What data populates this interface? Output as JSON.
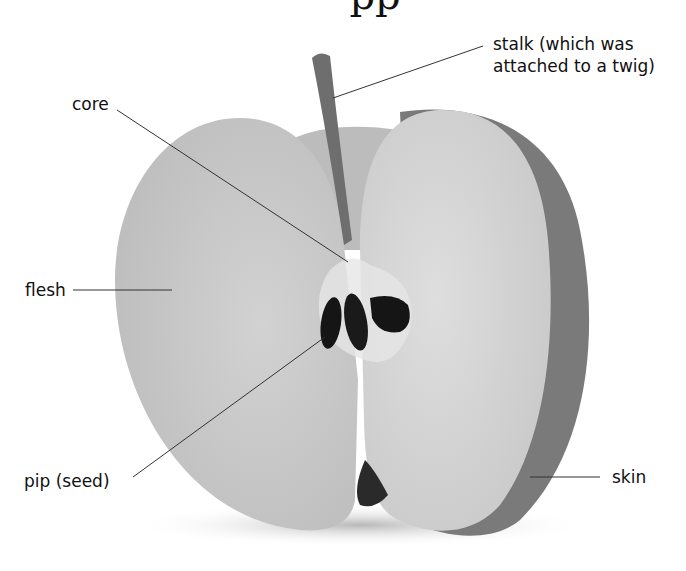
{
  "diagram": {
    "title_fragment": "pp",
    "labels": {
      "stalk": "stalk (which was",
      "stalk_line2": "attached to a twig)",
      "core": "core",
      "flesh": "flesh",
      "pip": "pip (seed)",
      "skin": "skin"
    }
  }
}
